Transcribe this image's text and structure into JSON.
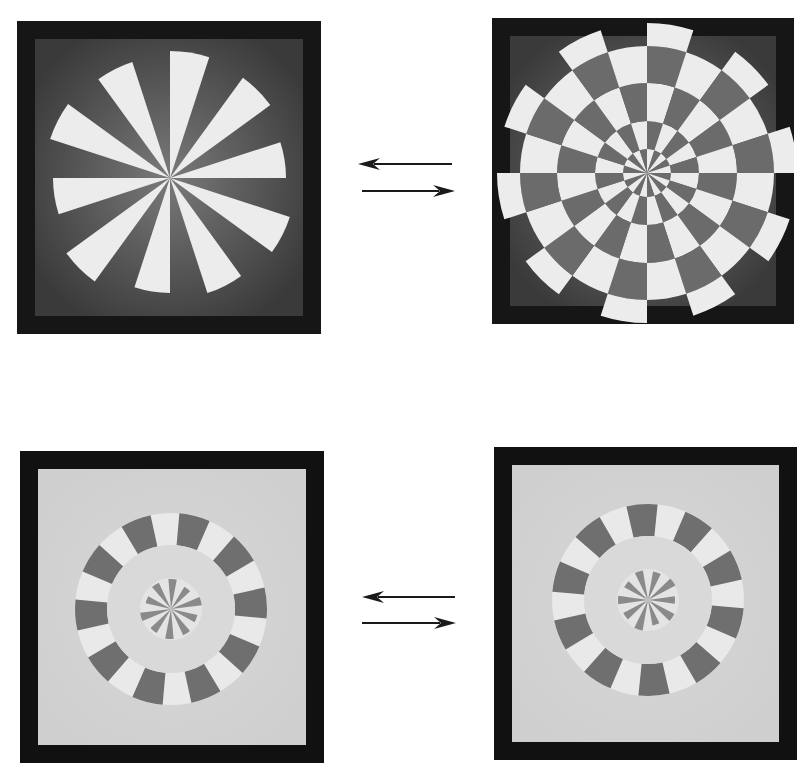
{
  "figure": {
    "description": "Paired rotating sector stimuli with reversible transition arrows",
    "background_color": "#ffffff"
  },
  "panels": [
    {
      "id": "top-left",
      "label": "Radial fan (10 light sectors on dark field)",
      "frame": {
        "x": 17,
        "y": 21,
        "w": 304,
        "h": 313
      },
      "frame_color": "#161616",
      "inner_field": {
        "inset": 18,
        "color": "#3a3a3a",
        "glow_color": "#7a7a7a"
      },
      "center": {
        "cx": 153,
        "cy": 157
      },
      "pattern": {
        "type": "fan",
        "sectors": 20,
        "start_deg": -90,
        "light_color": "#ececec",
        "outer_radii": [
          127,
          0,
          124,
          0,
          116,
          0,
          126,
          0,
          121,
          0,
          115,
          0,
          128,
          0,
          117,
          0,
          126,
          0,
          122,
          0
        ]
      }
    },
    {
      "id": "top-right",
      "label": "Checkerboard dartboard on dark field",
      "frame": {
        "x": 492,
        "y": 18,
        "w": 302,
        "h": 306
      },
      "frame_color": "#161616",
      "inner_field": {
        "inset": 18,
        "color": "#3a3a3a",
        "glow_color": "#7a7a7a"
      },
      "center": {
        "cx": 155,
        "cy": 155
      },
      "pattern": {
        "type": "checker",
        "sectors": 20,
        "start_deg": -90,
        "rings": [
          0,
          24,
          52,
          90,
          127
        ],
        "outer_tab_radius": 150,
        "light_color": "#ececec",
        "dark_color": "#6b6b6b"
      }
    },
    {
      "id": "bottom-left",
      "label": "Light field with tabbed ring and inner spokes",
      "frame": {
        "x": 20,
        "y": 451,
        "w": 304,
        "h": 312
      },
      "frame_color": "#111111",
      "inner_field": {
        "inset": 18,
        "color": "#cfcfcf",
        "glow_color": "#d8d8d8"
      },
      "center": {
        "cx": 151,
        "cy": 158
      },
      "pattern": {
        "type": "ringed",
        "ring_outer": 96,
        "ring_inner": 64,
        "ring_color": "#e9e9e9",
        "annulus_color": "#d9d9d9",
        "tabs": 10,
        "tab_start_deg": -85,
        "tab_color": "#6f6f6f",
        "core_radius": 31,
        "core_color": "#e4e4e4",
        "spokes": 10,
        "spoke_start_deg": -95,
        "spoke_color": "#8a8a8a",
        "spoke_lengths": [
          30,
          26,
          31,
          27,
          29,
          30,
          28,
          31,
          26,
          29
        ]
      }
    },
    {
      "id": "bottom-right",
      "label": "Light field with tabbed ring and inner spokes (rotated)",
      "frame": {
        "x": 494,
        "y": 447,
        "w": 303,
        "h": 313
      },
      "frame_color": "#111111",
      "inner_field": {
        "inset": 18,
        "color": "#cfcfcf",
        "glow_color": "#d8d8d8"
      },
      "center": {
        "cx": 154,
        "cy": 153
      },
      "pattern": {
        "type": "ringed",
        "ring_outer": 96,
        "ring_inner": 64,
        "ring_color": "#e9e9e9",
        "annulus_color": "#d9d9d9",
        "tabs": 10,
        "tab_start_deg": -103,
        "tab_color": "#6f6f6f",
        "core_radius": 31,
        "core_color": "#e4e4e4",
        "spokes": 10,
        "spoke_start_deg": -80,
        "spoke_color": "#8a8a8a",
        "spoke_lengths": [
          29,
          31,
          27,
          30,
          26,
          31,
          28,
          30,
          27,
          30
        ]
      }
    }
  ],
  "arrows": [
    {
      "id": "top-left-arrow",
      "direction": "left",
      "x1": 358,
      "x2": 452,
      "y": 164,
      "color": "#1a1a1a"
    },
    {
      "id": "top-right-arrow",
      "direction": "right",
      "x1": 362,
      "x2": 455,
      "y": 191,
      "color": "#1a1a1a"
    },
    {
      "id": "bottom-left-arrow",
      "direction": "left",
      "x1": 362,
      "x2": 455,
      "y": 597,
      "color": "#1a1a1a"
    },
    {
      "id": "bottom-right-arrow",
      "direction": "right",
      "x1": 362,
      "x2": 456,
      "y": 623,
      "color": "#1a1a1a"
    }
  ]
}
